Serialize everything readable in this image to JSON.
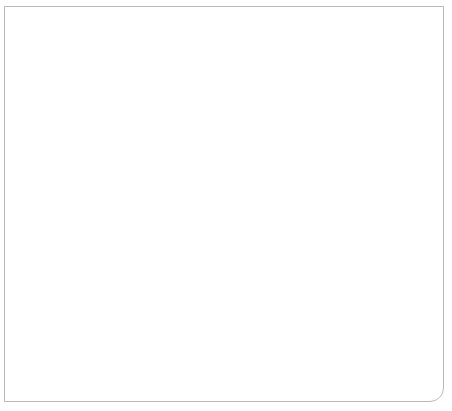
{
  "figure": {
    "frame_border_color": "#b9b9b9",
    "background": "#ffffff",
    "grid_color": "#c9c9c9",
    "axis_color": "#4a4a4a"
  },
  "axis": {
    "ylabel": "NUMBER OF MEMBERS",
    "y_ticks": [
      "0",
      "10",
      "20",
      "30",
      "40",
      "50",
      "60",
      "70",
      "80",
      "90",
      "100"
    ],
    "x_ticks": [
      "1971",
      "1975",
      "1979",
      "1983",
      "1987",
      "1991",
      "1995",
      "1999",
      "2003",
      "2007",
      "2010"
    ]
  },
  "annotations": [
    {
      "name": "series-label-women",
      "text": "Women"
    },
    {
      "name": "series-label-african-americans",
      "text": "African"
    },
    {
      "name": "series-label-african-americans-2",
      "text": "Americans"
    },
    {
      "name": "series-label-latinos",
      "text": "Latinos"
    }
  ],
  "chart_data": {
    "type": "line",
    "title": "",
    "subtitle": "",
    "xlabel": "",
    "ylabel": "NUMBER OF MEMBERS",
    "xlim": [
      1971,
      2011
    ],
    "ylim": [
      0,
      100
    ],
    "y_tick_step": 10,
    "x_tick_labels": [
      "1971",
      "1975",
      "1979",
      "1983",
      "1987",
      "1991",
      "1995",
      "1999",
      "2003",
      "2007",
      "2010"
    ],
    "x_gridline_years": [
      1971,
      1973,
      1975,
      1977,
      1979,
      1981,
      1983,
      1985,
      1987,
      1989,
      1991,
      1993,
      1995,
      1997,
      1999,
      2001,
      2003,
      2005,
      2007,
      2009,
      2010
    ],
    "grid": true,
    "legend": "inline-labels",
    "x": [
      1971,
      1973,
      1975,
      1977,
      1979,
      1981,
      1983,
      1985,
      1987,
      1989,
      1991,
      1993,
      1995,
      1997,
      1999,
      2001,
      2003,
      2005,
      2007,
      2009,
      2010
    ],
    "series": [
      {
        "name": "Women",
        "color": "#808080",
        "label_text": "Women",
        "values": [
          14,
          16,
          19,
          19,
          17,
          20,
          23,
          23,
          24,
          26,
          31,
          55,
          59,
          62,
          66,
          70,
          77,
          78,
          79,
          91,
          95
        ]
      },
      {
        "name": "African Americans",
        "color": "#a9a9a9",
        "label_text": "African Americans",
        "values": [
          13,
          16,
          18,
          17,
          16,
          18,
          21,
          21,
          23,
          24,
          26,
          40,
          40,
          40,
          39,
          37,
          39,
          40,
          41,
          42,
          42
        ]
      },
      {
        "name": "Latinos",
        "color": "#808080",
        "label_text": "Latinos",
        "values": [
          6,
          6,
          6,
          5,
          6,
          6,
          11,
          11,
          11,
          11,
          10,
          19,
          19,
          19,
          21,
          22,
          25,
          25,
          27,
          30,
          31
        ]
      }
    ]
  }
}
